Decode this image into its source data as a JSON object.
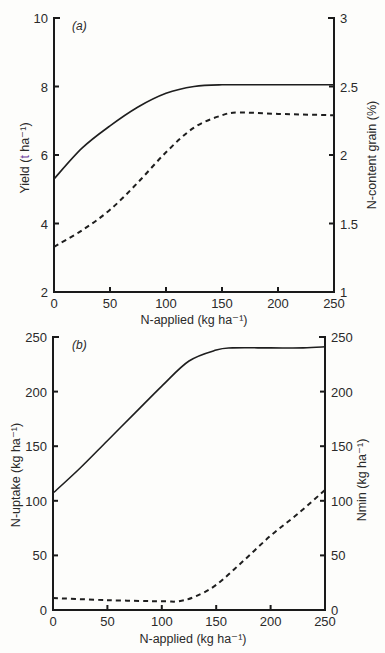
{
  "chart_data": [
    {
      "type": "line",
      "panel": "(a)",
      "xlabel": "N-applied (kg ha⁻¹)",
      "ylabel": "Yield (t ha⁻¹)",
      "y2label": "N-content grain (%)",
      "xlim": [
        0,
        250
      ],
      "ylim": [
        2,
        10
      ],
      "y2lim": [
        1,
        3
      ],
      "xticks": [
        "0",
        "50",
        "100",
        "150",
        "200",
        "250"
      ],
      "yticks": [
        "2",
        "4",
        "6",
        "8",
        "10"
      ],
      "y2ticks": [
        "1",
        "1.5",
        "2",
        "2.5",
        "3"
      ],
      "grid": false,
      "series": [
        {
          "name": "Yield",
          "style": "solid",
          "axis": "left",
          "x": [
            0,
            25,
            50,
            75,
            100,
            125,
            150,
            200,
            250
          ],
          "values": [
            5.3,
            6.2,
            6.85,
            7.4,
            7.8,
            8.0,
            8.05,
            8.05,
            8.05
          ]
        },
        {
          "name": "N-content grain",
          "style": "dashed",
          "axis": "right",
          "x": [
            0,
            25,
            50,
            75,
            100,
            125,
            150,
            165,
            200,
            250
          ],
          "values": [
            1.33,
            1.45,
            1.6,
            1.8,
            2.02,
            2.2,
            2.29,
            2.31,
            2.3,
            2.29
          ]
        }
      ]
    },
    {
      "type": "line",
      "panel": "(b)",
      "xlabel": "N-applied (kg ha⁻¹)",
      "ylabel": "N-uptake (kg ha⁻¹)",
      "y2label": "Nmin (kg ha⁻¹)",
      "xlim": [
        0,
        250
      ],
      "ylim": [
        0,
        250
      ],
      "y2lim": [
        0,
        250
      ],
      "xticks": [
        "0",
        "50",
        "100",
        "150",
        "200",
        "250"
      ],
      "yticks": [
        "0",
        "50",
        "100",
        "150",
        "200",
        "250"
      ],
      "y2ticks": [
        "0",
        "50",
        "100",
        "150",
        "200",
        "250"
      ],
      "grid": false,
      "series": [
        {
          "name": "N-uptake",
          "style": "solid",
          "axis": "left",
          "x": [
            0,
            25,
            50,
            75,
            100,
            125,
            150,
            165,
            200,
            230,
            250
          ],
          "values": [
            107,
            130,
            155,
            180,
            205,
            228,
            238,
            240,
            240,
            240,
            241
          ]
        },
        {
          "name": "Nmin",
          "style": "dashed",
          "axis": "right",
          "x": [
            0,
            50,
            100,
            115,
            130,
            150,
            175,
            200,
            225,
            250
          ],
          "values": [
            11,
            9,
            8,
            8,
            12,
            23,
            45,
            68,
            88,
            110
          ]
        }
      ]
    }
  ],
  "labels": {
    "a": {
      "panel": "(a)",
      "ylabel_prefix": "Yield (",
      "ylabel_unit_t": "t",
      "ylabel_suffix": " ha⁻¹)",
      "y2label": "N-content grain (%)",
      "xlabel": "N-applied (kg ha⁻¹)"
    },
    "b": {
      "panel": "(b)",
      "ylabel": "N-uptake (kg ha⁻¹)",
      "y2label": "Nmin (kg ha⁻¹)",
      "xlabel": "N-applied (kg ha⁻¹)"
    }
  }
}
